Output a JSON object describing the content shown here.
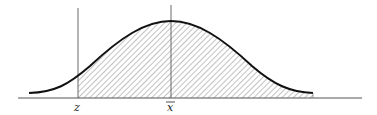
{
  "diagram": {
    "type": "normal-distribution-curve",
    "shaded_region": "area under curve to the right of z",
    "labels": {
      "z": "z",
      "xbar": "x"
    },
    "xbar_has_overline": true,
    "colors": {
      "curve": "#111111",
      "axis": "#555555",
      "hatch": "#666666",
      "background": "#ffffff"
    }
  }
}
